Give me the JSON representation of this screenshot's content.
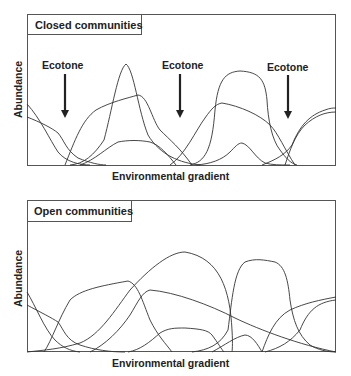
{
  "panels": [
    {
      "title": "Closed communities",
      "xlabel": "Environmental gradient",
      "ylabel": "Abundance",
      "annotations": [
        {
          "text": "Ecotone",
          "icon": "arrow-down-icon"
        },
        {
          "text": "Ecotone",
          "icon": "arrow-down-icon"
        },
        {
          "text": "Ecotone",
          "icon": "arrow-down-icon"
        }
      ]
    },
    {
      "title": "Open communities",
      "xlabel": "Environmental gradient",
      "ylabel": "Abundance"
    }
  ],
  "colors": {
    "line": "#333333",
    "frame": "#555555",
    "background": "#ffffff"
  }
}
